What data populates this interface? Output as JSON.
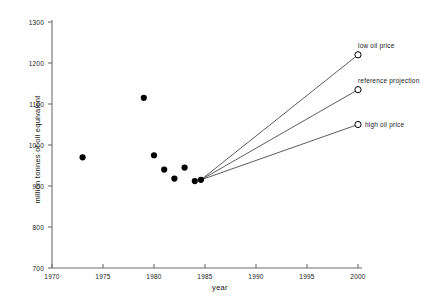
{
  "chart_data": {
    "type": "scatter",
    "title": "",
    "xlabel": "year",
    "ylabel": "million tonnes of oil equivalent",
    "xlim": [
      1970,
      2000
    ],
    "ylim": [
      700,
      1300
    ],
    "xticks": [
      1970,
      1975,
      1980,
      1985,
      1990,
      1995,
      2000
    ],
    "xtick_labels": [
      "1970",
      "1975",
      "1980",
      "1985",
      "1990",
      "1995",
      "2000"
    ],
    "yticks": [
      700,
      800,
      900,
      1000,
      1100,
      1200,
      1300
    ],
    "ytick_labels": [
      "700",
      "800",
      "900",
      "1000",
      "1100",
      "1200",
      "1300"
    ],
    "grid": false,
    "legend_position": "inline-right-annotations",
    "marker_color": "#000000",
    "line_color": "#333333",
    "series": [
      {
        "name": "historical",
        "marker": "filled-circle",
        "x": [
          1973,
          1979,
          1980,
          1981,
          1982,
          1983,
          1984,
          1984.6
        ],
        "values": [
          970,
          1115,
          975,
          940,
          918,
          945,
          912,
          915
        ]
      },
      {
        "name": "low oil price",
        "marker": "open-circle",
        "annotation": "low oil price",
        "x": [
          1984.6,
          2000
        ],
        "values": [
          915,
          1220
        ]
      },
      {
        "name": "reference projection",
        "marker": "open-circle",
        "annotation": "reference projection",
        "x": [
          1984.6,
          2000
        ],
        "values": [
          915,
          1135
        ]
      },
      {
        "name": "high oil price",
        "marker": "open-circle",
        "annotation": "high oil price",
        "x": [
          1984.6,
          2000
        ],
        "values": [
          915,
          1050
        ]
      }
    ],
    "annotations": [
      {
        "text": "low oil price",
        "x": 2000,
        "y": 1265
      },
      {
        "text": "reference projection",
        "x": 2000,
        "y": 1180
      },
      {
        "text": "high oil price",
        "x": 2000,
        "y": 1050
      }
    ]
  }
}
